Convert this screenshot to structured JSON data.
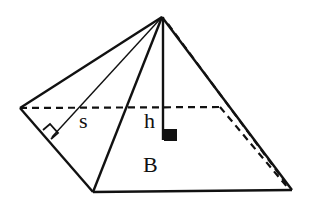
{
  "figure": {
    "type": "square-pyramid",
    "labels": {
      "slant_height": "s",
      "height": "h",
      "base": "B"
    },
    "colors": {
      "stroke": "#111111",
      "background": "#ffffff"
    }
  }
}
